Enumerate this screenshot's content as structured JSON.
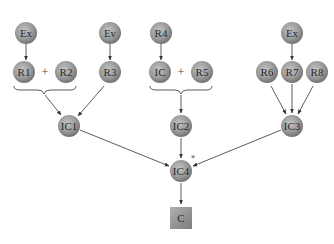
{
  "diagram": {
    "colors": {
      "node_fill_center": "#b8b8b8",
      "node_fill_edge": "#7a7a7a",
      "edge": "#333333",
      "text": "#2a2a2a",
      "background": "#ffffff"
    },
    "nodes": [
      {
        "id": "ex1",
        "label": "Ex",
        "shape": "circle",
        "x": 26,
        "y": 33
      },
      {
        "id": "r1",
        "label": "R1",
        "shape": "circle",
        "x": 24,
        "y": 72
      },
      {
        "id": "r2",
        "label": "R2",
        "shape": "circle",
        "x": 66,
        "y": 72
      },
      {
        "id": "ev",
        "label": "Ev",
        "shape": "circle",
        "x": 110,
        "y": 33
      },
      {
        "id": "r3",
        "label": "R3",
        "shape": "circle",
        "x": 110,
        "y": 72
      },
      {
        "id": "r4",
        "label": "R4",
        "shape": "circle",
        "x": 161,
        "y": 33
      },
      {
        "id": "ic",
        "label": "IC",
        "shape": "circle",
        "x": 160,
        "y": 72
      },
      {
        "id": "r5",
        "label": "R5",
        "shape": "circle",
        "x": 202,
        "y": 72
      },
      {
        "id": "ex2",
        "label": "Ex",
        "shape": "circle",
        "x": 292,
        "y": 33
      },
      {
        "id": "r6",
        "label": "R6",
        "shape": "circle",
        "x": 267,
        "y": 72
      },
      {
        "id": "r7",
        "label": "R7",
        "shape": "circle",
        "x": 292,
        "y": 72
      },
      {
        "id": "r8",
        "label": "R8",
        "shape": "circle",
        "x": 317,
        "y": 72
      },
      {
        "id": "ic1",
        "label": "IC1",
        "shape": "circle",
        "x": 69,
        "y": 126
      },
      {
        "id": "ic2",
        "label": "IC2",
        "shape": "circle",
        "x": 181,
        "y": 126
      },
      {
        "id": "ic3",
        "label": "IC3",
        "shape": "circle",
        "x": 292,
        "y": 126
      },
      {
        "id": "ic4",
        "label": "IC4",
        "shape": "circle",
        "x": 181,
        "y": 171,
        "annotation": "*"
      },
      {
        "id": "c",
        "label": "C",
        "shape": "square",
        "x": 181,
        "y": 218
      }
    ],
    "operators": [
      {
        "label": "+",
        "x": 45,
        "y": 72
      },
      {
        "label": "+",
        "x": 181,
        "y": 72
      }
    ],
    "edges": [
      {
        "from": "ex1",
        "to": "r1"
      },
      {
        "from": "ev",
        "to": "r3"
      },
      {
        "from": "r4",
        "to": "ic"
      },
      {
        "from": "ex2",
        "to": "r7"
      },
      {
        "from": "r1+r2",
        "to": "ic1"
      },
      {
        "from": "r3",
        "to": "ic1"
      },
      {
        "from": "ic+r5",
        "to": "ic2"
      },
      {
        "from": "r6",
        "to": "ic3"
      },
      {
        "from": "r7",
        "to": "ic3"
      },
      {
        "from": "r8",
        "to": "ic3"
      },
      {
        "from": "ic1",
        "to": "ic4"
      },
      {
        "from": "ic2",
        "to": "ic4"
      },
      {
        "from": "ic3",
        "to": "ic4"
      },
      {
        "from": "ic4",
        "to": "c"
      }
    ]
  }
}
